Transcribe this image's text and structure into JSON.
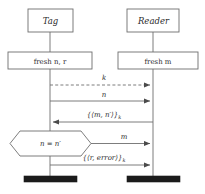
{
  "diagram": {
    "kind": "sequence-diagram",
    "title": "",
    "colors": {
      "stroke": "#6e6e6e",
      "text": "#2b2b2b",
      "background": "#ffffff",
      "terminator": "#1b1b1b"
    },
    "actors": [
      {
        "id": "tag",
        "label": "Tag",
        "lifeline_x": 50
      },
      {
        "id": "reader",
        "label": "Reader",
        "lifeline_x": 153
      }
    ],
    "activities": [
      {
        "id": "fresh-nr",
        "label": "fresh n, r",
        "actor": "tag"
      },
      {
        "id": "fresh-m",
        "label": "fresh m",
        "actor": "reader"
      }
    ],
    "messages": [
      {
        "id": "msg-k",
        "label": "k",
        "from": "tag",
        "to": "reader",
        "style": "dashed",
        "direction": "right"
      },
      {
        "id": "msg-n",
        "label": "n",
        "from": "tag",
        "to": "reader",
        "style": "solid",
        "direction": "right"
      },
      {
        "id": "msg-mn",
        "label": "{⟨m, n′⟩}",
        "sub": "k",
        "from": "reader",
        "to": "tag",
        "style": "solid",
        "direction": "left"
      },
      {
        "id": "msg-m",
        "label": "m",
        "from": "tag",
        "to": "reader",
        "style": "solid",
        "direction": "right"
      },
      {
        "id": "msg-rerror",
        "label": "{⟨r, error⟩}",
        "sub": "k",
        "from": "tag",
        "to": "reader",
        "style": "solid",
        "direction": "right"
      }
    ],
    "guards": [
      {
        "id": "guard-compare",
        "label": "n = n′",
        "actor": "tag",
        "shape": "hexagon"
      }
    ],
    "terminators": [
      {
        "id": "terminator-tag",
        "actor": "tag"
      },
      {
        "id": "terminator-reader",
        "actor": "reader"
      }
    ]
  }
}
